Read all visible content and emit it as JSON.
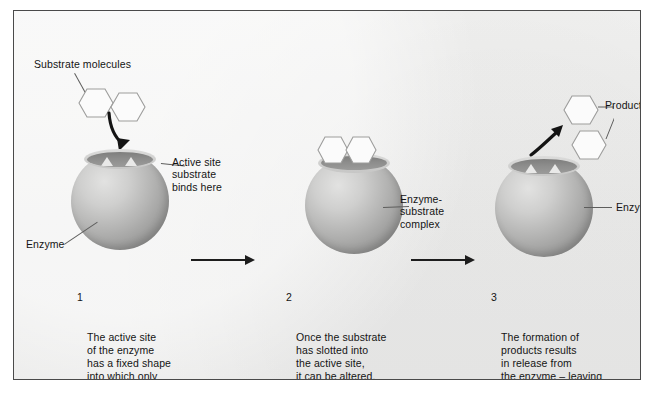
{
  "figure": {
    "background_color": "#efefee",
    "frame_color": "#4a4a4a",
    "text_color": "#141414",
    "enzyme_color": "#b3b3b2",
    "substrate_color": "#fbfbfb"
  },
  "labels": {
    "substrate_molecules": "Substrate molecules",
    "active_site": "Active site\nsubstrate\nbinds here",
    "enzyme_left": "Enzyme",
    "enzyme_substrate_complex": "Enzyme-\nsubstrate\ncomplex",
    "products": "Products",
    "enzyme_right": "Enzyme"
  },
  "steps": [
    {
      "number": "1",
      "text": "The active site\nof the enzyme\nhas a fixed shape\ninto which only\none particular\nsubstrate will fit."
    },
    {
      "number": "2",
      "text": "Once the substrate\nhas slotted into\nthe active site,\nit can be altered."
    },
    {
      "number": "3",
      "text": "The formation of\nproducts results\nin release from\nthe enzyme – leaving\nthe active site free\nfor more substrate\nmolecules."
    }
  ],
  "arrows": {
    "step1_to_step2": "process-arrow-right",
    "step2_to_step3": "process-arrow-right",
    "binding_arrow": "curved-arrow-down",
    "release_arrow": "curved-arrow-up-right"
  }
}
